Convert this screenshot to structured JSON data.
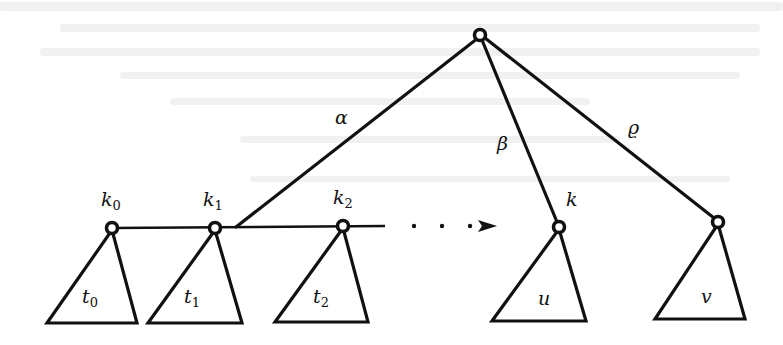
{
  "figure": {
    "type": "tree-diagram",
    "background_color": "#ffffff",
    "ink_color": "#111111"
  },
  "root": {
    "x": 480,
    "y": 35
  },
  "edges": {
    "alpha": {
      "label": "α",
      "label_x": 335,
      "label_y": 124
    },
    "beta": {
      "label": "β",
      "label_x": 498,
      "label_y": 150
    },
    "rho": {
      "label": "ϱ",
      "label_x": 628,
      "label_y": 134
    }
  },
  "chain": {
    "nodes": [
      {
        "id": "k0",
        "base": "k",
        "sub": "0",
        "x": 112,
        "y": 228,
        "label_x": 101,
        "label_y": 205
      },
      {
        "id": "k1",
        "base": "k",
        "sub": "1",
        "x": 215,
        "y": 228,
        "label_x": 203,
        "label_y": 205
      },
      {
        "id": "k2",
        "base": "k",
        "sub": "2",
        "x": 343,
        "y": 226,
        "label_x": 333,
        "label_y": 203
      }
    ],
    "dots": [
      414,
      442,
      470
    ],
    "arrow": {
      "x_start": 478,
      "x_end": 497,
      "y": 226
    }
  },
  "target_node": {
    "id": "k",
    "label": "k",
    "x": 559,
    "y": 227,
    "label_x": 566,
    "label_y": 206
  },
  "right_node": {
    "id": "r",
    "x": 718,
    "y": 222
  },
  "subtrees": [
    {
      "id": "t0",
      "base": "t",
      "sub": "0"
    },
    {
      "id": "t1",
      "base": "t",
      "sub": "1"
    },
    {
      "id": "t2",
      "base": "t",
      "sub": "2"
    },
    {
      "id": "u",
      "base": "u",
      "sub": ""
    },
    {
      "id": "v",
      "base": "v",
      "sub": ""
    }
  ]
}
